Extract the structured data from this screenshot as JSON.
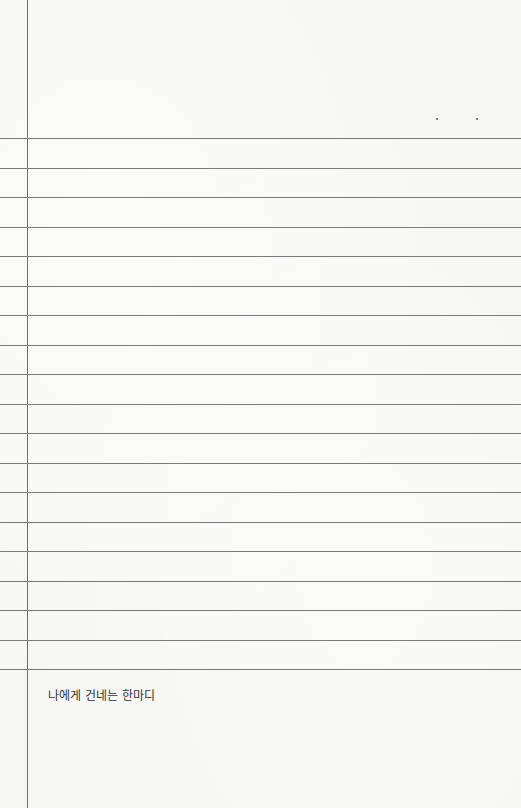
{
  "page": {
    "type": "lined-notebook-paper",
    "colors": {
      "paper": "#f6f6f4",
      "rule_line": "#7a7a7a",
      "margin_line": "#6e6e6e",
      "text": "#333333"
    },
    "rule_count": 19,
    "caption": "나에게 건네는 한마디"
  }
}
